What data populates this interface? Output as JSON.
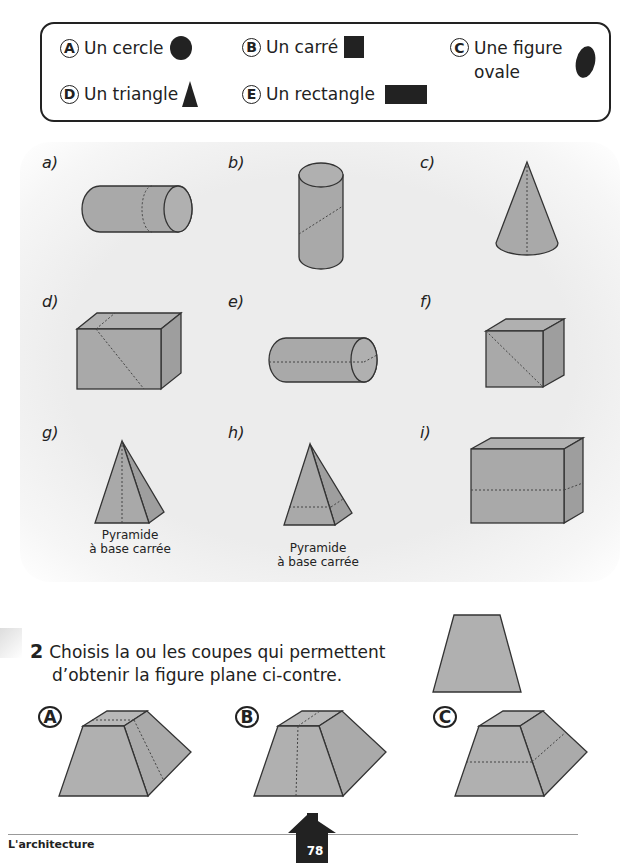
{
  "legend": {
    "options": [
      {
        "letter": "A",
        "label": "Un cercle",
        "shape": "circle"
      },
      {
        "letter": "B",
        "label": "Un carré",
        "shape": "square"
      },
      {
        "letter": "C",
        "label_line1": "Une figure",
        "label_line2": "ovale",
        "shape": "oval"
      },
      {
        "letter": "D",
        "label": "Un triangle",
        "shape": "triangle"
      },
      {
        "letter": "E",
        "label": "Un rectangle",
        "shape": "rectangle"
      }
    ]
  },
  "solids": [
    {
      "label": "a)",
      "shape": "cylinder-horizontal",
      "cut": "curved-vertical"
    },
    {
      "label": "b)",
      "shape": "cylinder-vertical",
      "cut": "oblique"
    },
    {
      "label": "c)",
      "shape": "cone",
      "cut": "vertical-axis"
    },
    {
      "label": "d)",
      "shape": "rectangular-prism",
      "cut": "diagonal"
    },
    {
      "label": "e)",
      "shape": "cylinder-horizontal",
      "cut": "horizontal-axis"
    },
    {
      "label": "f)",
      "shape": "cube",
      "cut": "diagonal"
    },
    {
      "label": "g)",
      "shape": "square-pyramid",
      "cut": "vertical",
      "caption_line1": "Pyramide",
      "caption_line2": "à base carrée"
    },
    {
      "label": "h)",
      "shape": "square-pyramid",
      "cut": "horizontal",
      "caption_line1": "Pyramide",
      "caption_line2": "à base carrée"
    },
    {
      "label": "i)",
      "shape": "rectangular-prism",
      "cut": "horizontal"
    }
  ],
  "question2": {
    "number": "2",
    "line1": "Choisis la ou les coupes qui permettent",
    "line2": "d’obtenir la figure plane ci-contre.",
    "target_shape": "trapezoid",
    "choices": [
      {
        "letter": "A",
        "cut": "vertical-side"
      },
      {
        "letter": "B",
        "cut": "vertical-front"
      },
      {
        "letter": "C",
        "cut": "horizontal"
      }
    ]
  },
  "footer": {
    "section": "L'architecture",
    "page": "78"
  },
  "colors": {
    "shape_fill": "#a9a9a9",
    "shape_stroke": "#333333",
    "ink": "#222222"
  }
}
